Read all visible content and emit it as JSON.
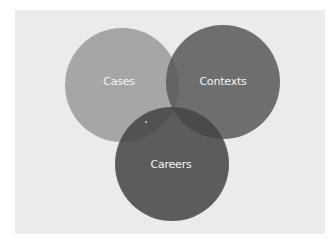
{
  "diagram": {
    "type": "venn",
    "background_color": "#ebebeb",
    "circles": [
      {
        "id": "cases",
        "label": "Cases",
        "cx": 122,
        "cy": 85,
        "r": 57,
        "color": "#a6a6a6",
        "opacity": 1.0
      },
      {
        "id": "contexts",
        "label": "Contexts",
        "cx": 223,
        "cy": 82,
        "r": 57,
        "color": "#5a5a5a",
        "opacity": 0.86
      },
      {
        "id": "careers",
        "label": "Careers",
        "cx": 172,
        "cy": 164,
        "r": 57,
        "color": "#454545",
        "opacity": 0.86
      }
    ],
    "labels": {
      "cases": "Cases",
      "contexts": "Contexts",
      "careers": "Careers"
    },
    "label_color": "#f4f4f4"
  }
}
